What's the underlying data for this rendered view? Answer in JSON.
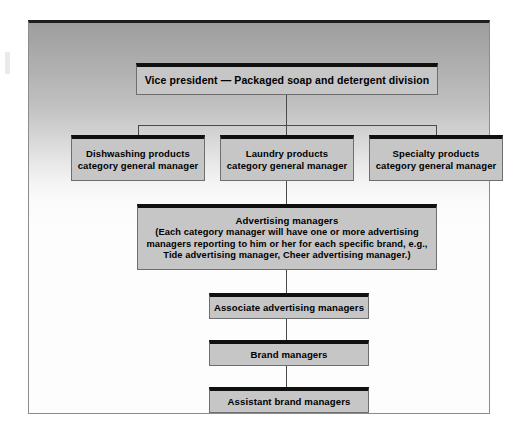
{
  "diagram": {
    "type": "organization-chart",
    "colors": {
      "box_fill": "#c6c6c6",
      "box_border": "#6e6e6e",
      "box_top_accent": "#101010",
      "connector": "#4a4a4a",
      "frame_border": "#8c8c8c",
      "text": "#000000"
    },
    "levels": [
      {
        "level": 1,
        "nodes": [
          {
            "id": "vice-president",
            "lines": [
              "Vice president — Packaged soap and detergent division"
            ]
          }
        ]
      },
      {
        "level": 2,
        "nodes": [
          {
            "id": "dishwashing",
            "lines": [
              "Dishwashing products",
              "category general manager"
            ]
          },
          {
            "id": "laundry",
            "lines": [
              "Laundry products",
              "category general manager"
            ]
          },
          {
            "id": "specialty",
            "lines": [
              "Specialty products",
              "category general manager"
            ]
          }
        ]
      },
      {
        "level": 3,
        "nodes": [
          {
            "id": "advertising-managers",
            "lines": [
              "Advertising managers",
              "(Each category manager will have one or more advertising",
              "managers reporting to him or her for each specific brand, e.g.,",
              "Tide advertising manager, Cheer advertising manager.)"
            ]
          }
        ]
      },
      {
        "level": 4,
        "nodes": [
          {
            "id": "associate-advertising-managers",
            "lines": [
              "Associate advertising managers"
            ]
          }
        ]
      },
      {
        "level": 5,
        "nodes": [
          {
            "id": "brand-managers",
            "lines": [
              "Brand managers"
            ]
          }
        ]
      },
      {
        "level": 6,
        "nodes": [
          {
            "id": "assistant-brand-managers",
            "lines": [
              "Assistant brand managers"
            ]
          }
        ]
      }
    ],
    "nodes": {
      "vice_president": "Vice president — Packaged soap and detergent division",
      "dishwashing_line1": "Dishwashing products",
      "dishwashing_line2": "category general manager",
      "laundry_line1": "Laundry products",
      "laundry_line2": "category general manager",
      "specialty_line1": "Specialty products",
      "specialty_line2": "category general manager",
      "advertising_title": "Advertising managers",
      "advertising_line1": "(Each category manager will have one or more advertising",
      "advertising_line2": "managers reporting to him or her for each specific brand, e.g.,",
      "advertising_line3": "Tide advertising manager, Cheer advertising manager.)",
      "associate_advertising_managers": "Associate advertising managers",
      "brand_managers": "Brand managers",
      "assistant_brand_managers": "Assistant brand managers"
    }
  }
}
